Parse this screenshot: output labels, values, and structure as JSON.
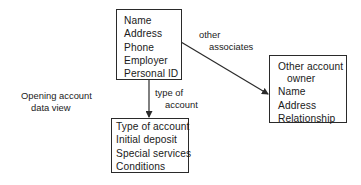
{
  "diagram": {
    "title": "Opening account data view",
    "caption": {
      "line1": "Opening account",
      "line2": "data view"
    },
    "nodes": {
      "customer": {
        "fields": [
          "Name",
          "Address",
          "Phone",
          "Employer",
          "Personal ID"
        ]
      },
      "account": {
        "fields": [
          "Type of account",
          "Initial deposit",
          "Special services",
          "Conditions"
        ]
      },
      "other_owner": {
        "heading_line1": "Other account",
        "heading_line2": "owner",
        "fields": [
          "Name",
          "Address",
          "Relationship"
        ]
      }
    },
    "edges": {
      "customer_to_account": {
        "label_line1": "type of",
        "label_line2": "account"
      },
      "customer_to_other_owner": {
        "label_line1": "other",
        "label_line2": "associates"
      }
    },
    "colors": {
      "line": "#2a2a2a",
      "text": "#1a1a1a",
      "background": "#ffffff"
    }
  }
}
